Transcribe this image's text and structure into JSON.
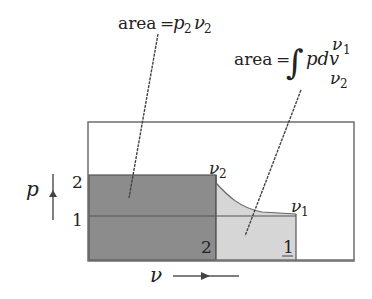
{
  "diagram": {
    "type": "p-v diagram",
    "colors": {
      "frame": "#6e6e6e",
      "dark_fill": "#8c8c8c",
      "light_fill": "#d6d6d6",
      "line": "#555555",
      "text": "#222222"
    },
    "labels": {
      "area_rect": {
        "prefix": "area",
        "eq": "=",
        "p": "p",
        "p_sub": "2",
        "v": "ν",
        "v_sub": "2"
      },
      "area_integral": {
        "prefix": "area",
        "eq": "=",
        "integral": "∫",
        "expr": "pdv",
        "upper": "ν",
        "upper_sub": "1",
        "lower": "ν",
        "lower_sub": "2"
      },
      "axis_p": "p",
      "axis_v": "ν",
      "p_tick_2": "2",
      "p_tick_1": "1",
      "v2_label": "ν",
      "v2_sub": "2",
      "v1_label": "ν",
      "v1_sub": "1",
      "state_2": "2",
      "state_1": "1"
    }
  }
}
